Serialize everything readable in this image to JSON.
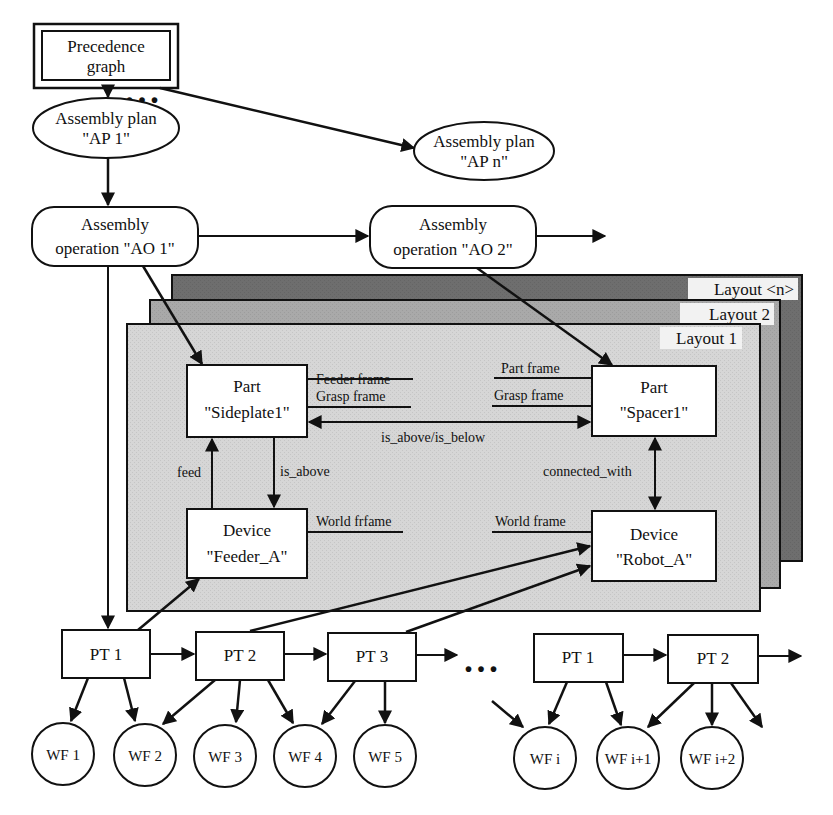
{
  "diagram": {
    "colors": {
      "layout_n": "#6e6e6e",
      "layout_2": "#a9a9a9",
      "layout_1": "#d6d6d6",
      "box_fill": "#ffffff",
      "stroke": "#111111"
    },
    "precedence_graph": {
      "line1": "Precedence",
      "line2": "graph"
    },
    "ellipsis_top": "• • •",
    "assembly_plans": [
      {
        "line1": "Assembly plan",
        "line2": "\"AP 1\""
      },
      {
        "line1": "Assembly plan",
        "line2": "\"AP n\""
      }
    ],
    "assembly_operations": [
      {
        "line1": "Assembly",
        "line2": "operation \"AO 1\""
      },
      {
        "line1": "Assembly",
        "line2": "operation \"AO 2\""
      }
    ],
    "layouts": [
      {
        "title": "Layout <n>"
      },
      {
        "title": "Layout 2"
      },
      {
        "title": "Layout 1"
      }
    ],
    "layout_nodes": {
      "part_sideplate": {
        "line1": "Part",
        "line2": "\"Sideplate1\""
      },
      "part_spacer": {
        "line1": "Part",
        "line2": "\"Spacer1\""
      },
      "device_feeder": {
        "line1": "Device",
        "line2": "\"Feeder_A\""
      },
      "device_robot": {
        "line1": "Device",
        "line2": "\"Robot_A\""
      }
    },
    "frame_labels": {
      "feeder_frame": "Feeder frame",
      "grasp_frame_left": "Grasp frame",
      "part_frame": "Part frame",
      "grasp_frame_right": "Grasp frame",
      "world_frame_left": "World frfame",
      "world_frame_right": "World frame"
    },
    "relations": {
      "is_above_is_below": "is_above/is_below",
      "feed": "feed",
      "is_above": "is_above",
      "connected_with": "connected_with"
    },
    "process_tasks": [
      "PT 1",
      "PT 2",
      "PT 3",
      "PT 1",
      "PT 2"
    ],
    "ellipsis_bottom": "• • •",
    "workflows": [
      "WF 1",
      "WF 2",
      "WF 3",
      "WF 4",
      "WF 5",
      "WF i",
      "WF i+1",
      "WF i+2"
    ]
  }
}
